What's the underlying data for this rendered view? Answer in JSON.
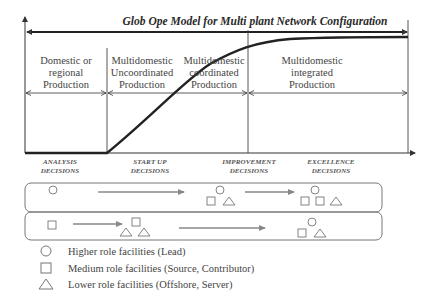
{
  "title": "Glob Ope Model for Multi plant Network Configuration",
  "phases": [
    {
      "label_lines": [
        "Domestic or",
        "regional",
        "Production"
      ]
    },
    {
      "label_lines": [
        "Multidomestic",
        "Uncoordinated",
        "Production"
      ]
    },
    {
      "label_lines": [
        "Multidomestic",
        "coordinated",
        "Production"
      ]
    },
    {
      "label_lines": [
        "Multidomestic",
        "integrated",
        "Production"
      ]
    }
  ],
  "decisions": [
    {
      "line1": "ANALYSIS",
      "line2": "DECISIONS"
    },
    {
      "line1": "START UP",
      "line2": "DECISIONS"
    },
    {
      "line1": "IMPROVEMENT",
      "line2": "DECISIONS"
    },
    {
      "line1": "EXCELLENCE",
      "line2": "DECISIONS"
    }
  ],
  "evolution_rows": [
    {
      "name": "lead-path",
      "stages": [
        "circle",
        "square+circle+triangle",
        "square+square+circle+triangle"
      ]
    },
    {
      "name": "source-path",
      "stages": [
        "square",
        "square+triangle+triangle",
        "square+circle+triangle"
      ]
    }
  ],
  "legend": [
    {
      "icon": "circle-icon",
      "label": "Higher role facilities (Lead)"
    },
    {
      "icon": "square-icon",
      "label": "Medium role facilities (Source, Contributor)"
    },
    {
      "icon": "triangle-icon",
      "label": "Lower role facilities (Offshore, Server)"
    }
  ],
  "colors": {
    "axis": "#333333",
    "curve": "#222222",
    "arrow_gray": "#888888",
    "shape_stroke": "#777777",
    "box_stroke": "#777777"
  }
}
